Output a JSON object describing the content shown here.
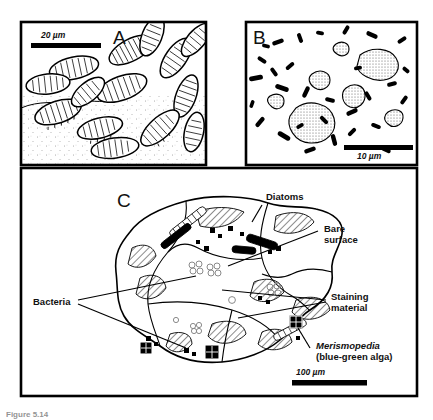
{
  "figure": {
    "type": "scientific-illustration",
    "caption_fragment": "Figure 5.14"
  },
  "panels": [
    {
      "id": "A",
      "letter": "A",
      "content": "diatom cells on sediment grain surface",
      "scale_bar": {
        "value": "20",
        "unit": "µm",
        "label": "20 µm",
        "text_position": "above"
      }
    },
    {
      "id": "B",
      "letter": "B",
      "content": "bacteria rods and stained aggregates",
      "scale_bar": {
        "value": "10",
        "unit": "µm",
        "label": "10 µm",
        "text_position": "below"
      }
    },
    {
      "id": "C",
      "letter": "C",
      "content": "sand grain surface map with annotated features",
      "scale_bar": {
        "value": "100",
        "unit": "µm",
        "label": "100 µm",
        "text_position": "above"
      }
    }
  ],
  "annotations": {
    "diatoms": "Diatoms",
    "bare_surface_line1": "Bare",
    "bare_surface_line2": "surface",
    "staining_line1": "Staining",
    "staining_line2": "material",
    "bacteria": "Bacteria",
    "merismopedia_genus": "Merismopedia",
    "merismopedia_common": "(blue-green alga)"
  },
  "colors": {
    "ink": "#000000",
    "background": "#ffffff",
    "stipple": "#7a7a7a"
  }
}
